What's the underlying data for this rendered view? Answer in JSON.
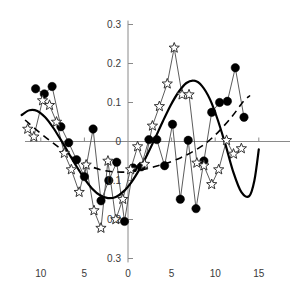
{
  "chart_data": {
    "type": "line",
    "title": "",
    "xlabel": "",
    "ylabel": "",
    "xlim": [
      -13.5,
      15.8
    ],
    "ylim": [
      -0.3,
      0.3
    ],
    "grid": false,
    "legend": "none",
    "x_ticks": [
      {
        "value": -10,
        "label": "10"
      },
      {
        "value": -5,
        "label": "5"
      },
      {
        "value": 0,
        "label": "0"
      },
      {
        "value": 5,
        "label": "5"
      },
      {
        "value": 10,
        "label": "10"
      },
      {
        "value": 15,
        "label": "15"
      }
    ],
    "y_ticks": [
      {
        "value": 0.3,
        "label": "0.3"
      },
      {
        "value": 0.2,
        "label": "0.2"
      },
      {
        "value": 0.1,
        "label": "0.1"
      },
      {
        "value": 0.0,
        "label": "0"
      },
      {
        "value": -0.1,
        "label": "0.1"
      },
      {
        "value": -0.2,
        "label": "0.2"
      },
      {
        "value": -0.3,
        "label": "0.3"
      }
    ],
    "series": [
      {
        "name": "filled-circle-series",
        "marker": "filled-circle",
        "color": "#000000",
        "points": [
          {
            "x": -10.6,
            "y": 0.135
          },
          {
            "x": -9.6,
            "y": 0.122
          },
          {
            "x": -8.7,
            "y": 0.141
          },
          {
            "x": -7.7,
            "y": 0.038
          },
          {
            "x": -6.8,
            "y": -0.003
          },
          {
            "x": -5.9,
            "y": -0.047
          },
          {
            "x": -5.0,
            "y": -0.09
          },
          {
            "x": -4.0,
            "y": 0.032
          },
          {
            "x": -3.1,
            "y": -0.152
          },
          {
            "x": -2.2,
            "y": -0.1
          },
          {
            "x": -1.3,
            "y": -0.053
          },
          {
            "x": -0.4,
            "y": -0.205
          },
          {
            "x": 0.6,
            "y": -0.068
          },
          {
            "x": 1.5,
            "y": -0.065
          },
          {
            "x": 2.4,
            "y": 0.005
          },
          {
            "x": 3.3,
            "y": 0.005
          },
          {
            "x": 4.2,
            "y": -0.062
          },
          {
            "x": 5.1,
            "y": 0.044
          },
          {
            "x": 6.0,
            "y": -0.148
          },
          {
            "x": 6.9,
            "y": 0.003
          },
          {
            "x": 7.8,
            "y": -0.172
          },
          {
            "x": 8.7,
            "y": -0.05
          },
          {
            "x": 9.6,
            "y": 0.075
          },
          {
            "x": 10.5,
            "y": 0.1
          },
          {
            "x": 11.4,
            "y": 0.103
          },
          {
            "x": 12.3,
            "y": 0.189
          },
          {
            "x": 13.3,
            "y": 0.062
          }
        ]
      },
      {
        "name": "open-star-series",
        "marker": "open-star",
        "color": "#333333",
        "points": [
          {
            "x": -11.5,
            "y": 0.032
          },
          {
            "x": -10.8,
            "y": 0.012
          },
          {
            "x": -9.8,
            "y": 0.105
          },
          {
            "x": -9.0,
            "y": 0.093
          },
          {
            "x": -8.2,
            "y": 0.05
          },
          {
            "x": -7.3,
            "y": -0.03
          },
          {
            "x": -6.5,
            "y": -0.072
          },
          {
            "x": -5.6,
            "y": -0.13
          },
          {
            "x": -4.8,
            "y": -0.06
          },
          {
            "x": -3.9,
            "y": -0.177
          },
          {
            "x": -3.1,
            "y": -0.222
          },
          {
            "x": -2.3,
            "y": -0.05
          },
          {
            "x": -1.4,
            "y": -0.2
          },
          {
            "x": -0.6,
            "y": -0.148
          },
          {
            "x": 0.3,
            "y": -0.072
          },
          {
            "x": 1.1,
            "y": -0.013
          },
          {
            "x": 1.9,
            "y": -0.058
          },
          {
            "x": 2.8,
            "y": 0.04
          },
          {
            "x": 3.6,
            "y": 0.09
          },
          {
            "x": 4.5,
            "y": 0.148
          },
          {
            "x": 5.3,
            "y": 0.24
          },
          {
            "x": 6.2,
            "y": 0.12
          },
          {
            "x": 7.0,
            "y": 0.12
          },
          {
            "x": 7.9,
            "y": -0.055
          },
          {
            "x": 8.7,
            "y": -0.062
          },
          {
            "x": 9.6,
            "y": -0.11
          },
          {
            "x": 10.4,
            "y": -0.072
          },
          {
            "x": 11.3,
            "y": 0.003
          },
          {
            "x": 12.1,
            "y": -0.032
          },
          {
            "x": 13.0,
            "y": -0.018
          }
        ]
      }
    ],
    "fitted_curves": [
      {
        "name": "solid-smooth-curve",
        "style": "solid",
        "color": "#000000",
        "points": [
          {
            "x": -12.2,
            "y": 0.068
          },
          {
            "x": -11.3,
            "y": 0.08
          },
          {
            "x": -10.4,
            "y": 0.078
          },
          {
            "x": -9.5,
            "y": 0.062
          },
          {
            "x": -8.6,
            "y": 0.036
          },
          {
            "x": -7.7,
            "y": 0.004
          },
          {
            "x": -6.8,
            "y": -0.03
          },
          {
            "x": -5.9,
            "y": -0.064
          },
          {
            "x": -5.0,
            "y": -0.095
          },
          {
            "x": -4.1,
            "y": -0.121
          },
          {
            "x": -3.2,
            "y": -0.138
          },
          {
            "x": -2.3,
            "y": -0.145
          },
          {
            "x": -1.4,
            "y": -0.142
          },
          {
            "x": -0.5,
            "y": -0.128
          },
          {
            "x": 0.4,
            "y": -0.104
          },
          {
            "x": 1.3,
            "y": -0.072
          },
          {
            "x": 2.2,
            "y": -0.034
          },
          {
            "x": 3.1,
            "y": 0.008
          },
          {
            "x": 4.0,
            "y": 0.052
          },
          {
            "x": 4.9,
            "y": 0.093
          },
          {
            "x": 5.8,
            "y": 0.127
          },
          {
            "x": 6.7,
            "y": 0.15
          },
          {
            "x": 7.6,
            "y": 0.156
          },
          {
            "x": 8.5,
            "y": 0.142
          },
          {
            "x": 9.4,
            "y": 0.108
          },
          {
            "x": 10.3,
            "y": 0.055
          },
          {
            "x": 11.2,
            "y": -0.01
          },
          {
            "x": 12.1,
            "y": -0.08
          },
          {
            "x": 13.0,
            "y": -0.13
          },
          {
            "x": 13.9,
            "y": -0.14
          },
          {
            "x": 14.5,
            "y": -0.1
          },
          {
            "x": 15.0,
            "y": -0.02
          }
        ]
      },
      {
        "name": "dashed-trend-curve",
        "style": "dashed",
        "color": "#000000",
        "points": [
          {
            "x": -11.8,
            "y": 0.055
          },
          {
            "x": -10.5,
            "y": 0.03
          },
          {
            "x": -9.0,
            "y": 0.003
          },
          {
            "x": -7.5,
            "y": -0.022
          },
          {
            "x": -6.0,
            "y": -0.045
          },
          {
            "x": -4.5,
            "y": -0.062
          },
          {
            "x": -3.0,
            "y": -0.073
          },
          {
            "x": -1.5,
            "y": -0.078
          },
          {
            "x": 0.0,
            "y": -0.078
          },
          {
            "x": 1.5,
            "y": -0.073
          },
          {
            "x": 3.0,
            "y": -0.065
          },
          {
            "x": 4.5,
            "y": -0.055
          },
          {
            "x": 6.0,
            "y": -0.042
          },
          {
            "x": 7.5,
            "y": -0.025
          },
          {
            "x": 9.0,
            "y": -0.003
          },
          {
            "x": 10.5,
            "y": 0.028
          },
          {
            "x": 12.0,
            "y": 0.066
          },
          {
            "x": 13.2,
            "y": 0.102
          },
          {
            "x": 14.0,
            "y": 0.118
          }
        ]
      }
    ]
  }
}
